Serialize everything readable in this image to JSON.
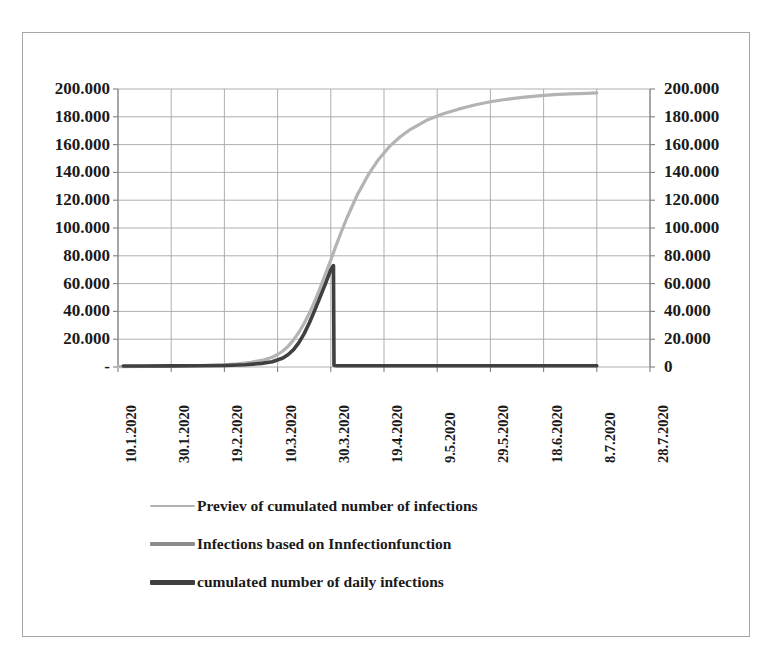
{
  "chart_data": {
    "type": "line",
    "title": "",
    "xlabel": "",
    "ylabel": "",
    "ylim": [
      0,
      200000
    ],
    "y_ticks": [
      200000,
      180000,
      160000,
      140000,
      120000,
      100000,
      80000,
      60000,
      40000,
      20000,
      0
    ],
    "y_tick_labels_left": [
      "200.000",
      "180.000",
      "160.000",
      "140.000",
      "120.000",
      "100.000",
      "80.000",
      "60.000",
      "40.000",
      "20.000",
      "-"
    ],
    "y_tick_labels_right": [
      "200.000",
      "180.000",
      "160.000",
      "140.000",
      "120.000",
      "100.000",
      "80.000",
      "60.000",
      "40.000",
      "20.000",
      "0"
    ],
    "secondary_axis": true,
    "grid": true,
    "legend_position": "bottom",
    "x_tick_labels": [
      "10.1.2020",
      "30.1.2020",
      "19.2.2020",
      "10.3.2020",
      "30.3.2020",
      "19.4.2020",
      "9.5.2020",
      "29.5.2020",
      "18.6.2020",
      "8.7.2020",
      "28.7.2020"
    ],
    "x_tick_values": [
      0,
      20,
      40,
      60,
      80,
      100,
      120,
      140,
      160,
      180,
      200
    ],
    "xlim": [
      0,
      200
    ],
    "series": [
      {
        "name": "Previev of cumulated number of infections",
        "color": "#b3b3b3",
        "width": 3.2,
        "x": [
          0,
          10,
          20,
          30,
          40,
          45,
          50,
          55,
          58,
          60,
          62,
          64,
          66,
          68,
          70,
          72,
          74,
          76,
          78,
          80,
          82,
          84,
          86,
          90,
          94,
          98,
          102,
          106,
          110,
          116,
          122,
          128,
          134,
          140,
          146,
          152,
          158,
          164,
          170,
          176,
          180
        ],
        "y": [
          300,
          400,
          600,
          900,
          1600,
          2300,
          3400,
          5200,
          7000,
          9000,
          11500,
          15000,
          19500,
          25000,
          31500,
          39000,
          47500,
          57000,
          67000,
          77000,
          87500,
          97500,
          107000,
          124000,
          138000,
          149500,
          158500,
          165500,
          171000,
          177500,
          182000,
          185500,
          188500,
          190800,
          192600,
          194000,
          195100,
          195900,
          196500,
          196900,
          197200
        ]
      },
      {
        "name": "Infections based on Innfectionfunction",
        "color": "#8c8c8c",
        "width": 3.4,
        "x": [],
        "y": []
      },
      {
        "name": "cumulated number of daily infections",
        "color": "#404040",
        "width": 3.6,
        "x": [
          2,
          10,
          20,
          30,
          40,
          48,
          54,
          58,
          62,
          64,
          66,
          68,
          70,
          72,
          74,
          76,
          78,
          80,
          81,
          81.2,
          82,
          90,
          100,
          120,
          140,
          160,
          180
        ],
        "y": [
          700,
          700,
          800,
          900,
          1100,
          1600,
          2600,
          3800,
          6500,
          9000,
          12500,
          17500,
          24000,
          32000,
          41000,
          50500,
          60000,
          70000,
          73000,
          1200,
          900,
          900,
          900,
          900,
          900,
          900,
          900
        ]
      }
    ]
  },
  "plot_area": {
    "left": 118,
    "top": 89,
    "right": 650,
    "bottom": 367,
    "grid_color": "#a6a6a6",
    "border_color": "#a6a6a6"
  },
  "legend": {
    "items": [
      {
        "label": "Previev of cumulated number of infections",
        "color": "#b3b3b3",
        "thickness": 2
      },
      {
        "label": "Infections based on Innfectionfunction",
        "color": "#8c8c8c",
        "thickness": 4
      },
      {
        "label": "cumulated number of daily infections",
        "color": "#404040",
        "thickness": 5
      }
    ]
  }
}
